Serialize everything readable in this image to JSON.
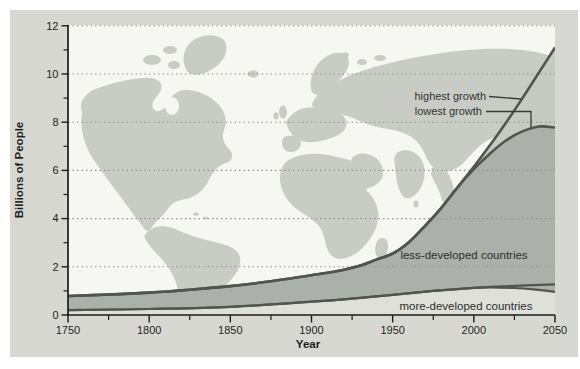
{
  "chart_data": {
    "type": "area",
    "title": "",
    "xlabel": "Year",
    "ylabel": "Billions of People",
    "xlim": [
      1750,
      2050
    ],
    "ylim": [
      0,
      12
    ],
    "x_tick_labels": [
      "1750",
      "1800",
      "1850",
      "1900",
      "1950",
      "2000",
      "2050"
    ],
    "x_tick_years": [
      1750,
      1800,
      1850,
      1900,
      1950,
      2000,
      2050
    ],
    "x_minor_tick_years": [
      1775,
      1825,
      1875,
      1925,
      1975,
      2025
    ],
    "y_tick_labels": [
      "0",
      "2",
      "4",
      "6",
      "8",
      "10",
      "12"
    ],
    "y_tick_values": [
      0,
      2,
      4,
      6,
      8,
      10,
      12
    ],
    "y_minor_tick_values": [
      1,
      3,
      5,
      7,
      9,
      11
    ],
    "grid": "dotted horizontal lines at major y ticks",
    "legend_position": "none",
    "background": "gray world map silhouette behind the plot",
    "series": [
      {
        "name": "world population - highest growth projection",
        "x": [
          1750,
          1775,
          1800,
          1825,
          1850,
          1875,
          1900,
          1910,
          1920,
          1930,
          1940,
          1950,
          1960,
          1970,
          1980,
          1990,
          2000,
          2010,
          2020,
          2030,
          2040,
          2050
        ],
        "values": [
          0.79,
          0.85,
          0.93,
          1.05,
          1.2,
          1.4,
          1.65,
          1.75,
          1.88,
          2.05,
          2.3,
          2.55,
          3.02,
          3.7,
          4.45,
          5.3,
          6.15,
          7.05,
          8.0,
          9.0,
          10.05,
          11.1
        ]
      },
      {
        "name": "world population - lowest growth projection",
        "x": [
          1750,
          1775,
          1800,
          1825,
          1850,
          1875,
          1900,
          1910,
          1920,
          1930,
          1940,
          1950,
          1960,
          1970,
          1980,
          1990,
          2000,
          2010,
          2020,
          2030,
          2040,
          2050
        ],
        "values": [
          0.79,
          0.85,
          0.93,
          1.05,
          1.2,
          1.4,
          1.65,
          1.75,
          1.88,
          2.05,
          2.3,
          2.55,
          3.02,
          3.7,
          4.45,
          5.3,
          6.05,
          6.7,
          7.25,
          7.62,
          7.82,
          7.78
        ]
      },
      {
        "name": "more-developed countries - high projection boundary",
        "x": [
          1750,
          1800,
          1850,
          1900,
          1925,
          1950,
          1975,
          2000,
          2010,
          2025,
          2050
        ],
        "values": [
          0.2,
          0.25,
          0.34,
          0.55,
          0.68,
          0.84,
          1.0,
          1.13,
          1.17,
          1.21,
          1.27
        ]
      },
      {
        "name": "more-developed countries - low projection boundary",
        "x": [
          1750,
          1800,
          1850,
          1900,
          1925,
          1950,
          1975,
          2000,
          2010,
          2025,
          2040,
          2050
        ],
        "values": [
          0.2,
          0.25,
          0.34,
          0.55,
          0.68,
          0.84,
          1.0,
          1.13,
          1.15,
          1.12,
          1.04,
          0.96
        ]
      }
    ],
    "annotations": [
      {
        "text": "highest growth",
        "points_to": "highest growth projection curve, value ~11 billion in 2050"
      },
      {
        "text": "lowest growth",
        "points_to": "lowest growth projection curve, flattening near ~7.8 billion by 2050"
      },
      {
        "text": "less-developed countries",
        "region": "dark band between more-developed boundary and total population curve"
      },
      {
        "text": "more-developed countries",
        "region": "light band between x-axis and boundary line, ~0.2 billion in 1750 to ~1.0-1.3 billion in 2050"
      }
    ]
  },
  "colors": {
    "page_bg": "#ffffff",
    "figure_bg": "#d7d8d2",
    "plot_bg": "#f6f6f2",
    "map": "#c9ccc5",
    "fill_highest_region": "#c6cac3",
    "fill_less_developed": "#abb0ab",
    "fill_more_developed": "#dee0d9",
    "curve": "#50554f",
    "grid": "#8f948e",
    "axis": "#1c1c1c",
    "leader_line": "#3a3a3a"
  }
}
